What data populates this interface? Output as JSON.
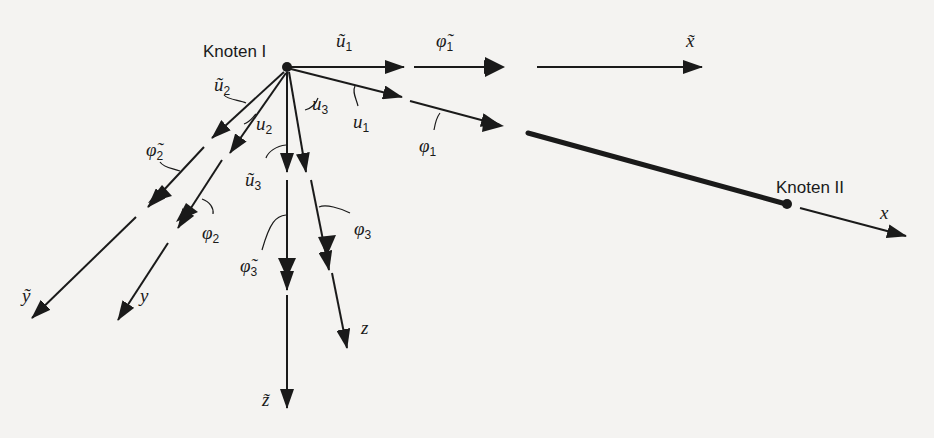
{
  "figure": {
    "nodes": [
      {
        "id": "node-1",
        "label": "Knoten I"
      },
      {
        "id": "node-2",
        "label": "Knoten II"
      }
    ],
    "global_axes": {
      "x": {
        "symbol": "x̃"
      },
      "y": {
        "symbol": "ỹ"
      },
      "z": {
        "symbol": "z̃"
      }
    },
    "local_axes": {
      "x": {
        "symbol": "x"
      },
      "y": {
        "symbol": "y"
      },
      "z": {
        "symbol": "z"
      }
    },
    "dof_labels": {
      "u1_tilde": {
        "base": "ũ",
        "sub": "1"
      },
      "phi1_tilde": {
        "base": "φ̃",
        "sub": "1"
      },
      "u1": {
        "base": "u",
        "sub": "1"
      },
      "phi1": {
        "base": "φ",
        "sub": "1"
      },
      "u2_tilde": {
        "base": "ũ",
        "sub": "2"
      },
      "u2": {
        "base": "u",
        "sub": "2"
      },
      "phi2_tilde": {
        "base": "φ̃",
        "sub": "2"
      },
      "phi2": {
        "base": "φ",
        "sub": "2"
      },
      "u3_tilde": {
        "base": "ũ",
        "sub": "3"
      },
      "u3": {
        "base": "u",
        "sub": "3"
      },
      "phi3_tilde": {
        "base": "φ̃",
        "sub": "3"
      },
      "phi3": {
        "base": "φ",
        "sub": "3"
      }
    },
    "colors": {
      "ink": "#1a1a1a",
      "paper": "#f4f3f1"
    }
  }
}
